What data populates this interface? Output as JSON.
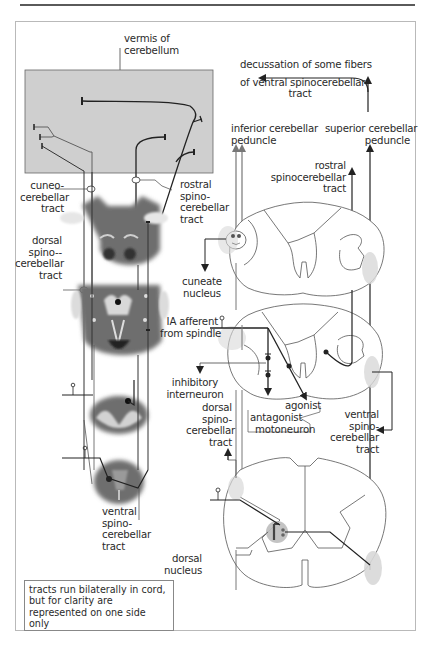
{
  "diagram": {
    "colors": {
      "cerebellum_box": "#cfcfcf",
      "brainstem_section": "#6e6e6e",
      "white_matter_highlight": "#d9d9d9",
      "tract_line": "#222222",
      "outline": "#555555",
      "tract_area_shading": "#d8d8d8"
    },
    "labels": {
      "vermis": [
        "vermis of",
        "cerebellum"
      ],
      "cuneocerebellar_tract": [
        "cuneo-",
        "cerebellar",
        "tract"
      ],
      "rostral_spinocerebellar_left": [
        "rostral",
        "spino-",
        "cerebellar",
        "tract"
      ],
      "dorsal_spinocerebellar_left": [
        "dorsal",
        "spino--",
        "cerebellar",
        "tract"
      ],
      "decussation": [
        "decussation of some  fibers",
        "of ventral spinocerebellar",
        "tract"
      ],
      "inferior_peduncle": [
        "inferior cerebellar",
        "peduncle"
      ],
      "superior_peduncle": [
        "superior cerebellar",
        "peduncle"
      ],
      "rostral_spinocerebellar_right": [
        "rostral",
        "spinocerebellar",
        "tract"
      ],
      "cuneate_nucleus": [
        "cuneate",
        "nucleus"
      ],
      "ia_afferent": [
        "IA afferent",
        "from spindle"
      ],
      "inhibitory_interneuron": [
        "inhibitory",
        "interneuron"
      ],
      "dorsal_spinocerebellar_right": [
        "dorsal",
        "spino-",
        "cerebellar",
        "tract"
      ],
      "agonist": "agonist",
      "antagonist": "antagonist",
      "motoneuron": "motoneuron",
      "ventral_spinocerebellar_right": [
        "ventral",
        "spino-",
        "cerebellar",
        "tract"
      ],
      "ventral_spinocerebellar_left": [
        "ventral",
        "spino-",
        "cerebellar",
        "tract"
      ],
      "dorsal_nucleus": [
        "dorsal",
        "nucleus"
      ]
    },
    "note": "tracts run bilaterally in cord, but for clarity are represented on one side only"
  }
}
